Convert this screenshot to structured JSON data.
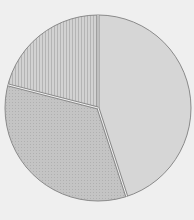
{
  "chart_data": {
    "type": "pie",
    "title": "",
    "labels": [
      "Slice A",
      "Slice B",
      "Slice C"
    ],
    "values": [
      45,
      34,
      21
    ],
    "start_angle_deg": 0,
    "direction": "clockwise",
    "legend": "none",
    "slices": [
      {
        "label": "Slice A",
        "value": 45,
        "fill": "#d6d6d6",
        "pattern": "solid",
        "position": "right"
      },
      {
        "label": "Slice B",
        "value": 34,
        "fill": "#c2c2c2",
        "pattern": "dots",
        "position": "lower-left"
      },
      {
        "label": "Slice C",
        "value": 21,
        "fill": "#cbcbcb",
        "pattern": "vertical-lines",
        "position": "upper-left"
      }
    ]
  },
  "colors": {
    "background": "#efefef",
    "outline": "#8a8a8a"
  }
}
